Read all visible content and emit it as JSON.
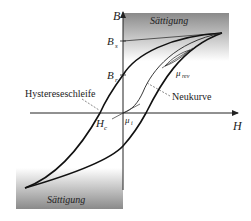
{
  "diagram": {
    "axes": {
      "x_label": "H",
      "y_label": "B"
    },
    "axis_markers": {
      "saturation_flux": "B",
      "saturation_flux_sub": "s",
      "remanence": "B",
      "remanence_sub": "r",
      "coercivity": "H",
      "coercivity_sub": "c"
    },
    "regions": {
      "saturation_top": "Sättigung",
      "saturation_bottom": "Sättigung"
    },
    "annotations": {
      "hysteresis_loop": "Hystereseschleife",
      "virgin_curve": "Neukurve",
      "reversible_permeability": "μ",
      "reversible_permeability_sub": "rev",
      "initial_permeability": "μ",
      "initial_permeability_sub": "i"
    },
    "colors": {
      "curve": "#111111",
      "axis": "#222222",
      "saturation_dark": "#8a8a8a",
      "saturation_light": "#ffffff",
      "leader_line": "#555555"
    }
  }
}
